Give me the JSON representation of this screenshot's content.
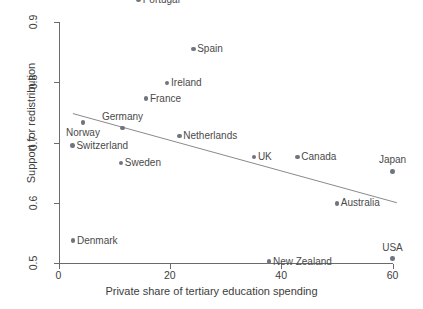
{
  "chart_data": {
    "type": "scatter",
    "title": "",
    "xlabel": "Private share of tertiary education spending",
    "ylabel": "Support for redistribution",
    "xlim": [
      0,
      60
    ],
    "ylim": [
      0.5,
      0.9
    ],
    "xticks": [
      "0",
      "20",
      "40",
      "60"
    ],
    "xtick_values": [
      0,
      20,
      40,
      60
    ],
    "yticks": [
      "0.5",
      "0.6",
      "0.7",
      "0.8",
      "0.9"
    ],
    "ytick_values": [
      0.5,
      0.6,
      0.7,
      0.8,
      0.9
    ],
    "grid": false,
    "legend": "none",
    "marker_color": "#6e7481",
    "line_color": "#8a8a8a",
    "axis_color": "#6b6b6b",
    "points": [
      {
        "label": "Portugal",
        "x": 14.4,
        "y": 0.937,
        "label_pos": "right"
      },
      {
        "label": "Spain",
        "x": 24.2,
        "y": 0.855,
        "label_pos": "right"
      },
      {
        "label": "Ireland",
        "x": 19.5,
        "y": 0.799,
        "label_pos": "right"
      },
      {
        "label": "France",
        "x": 15.7,
        "y": 0.773,
        "label_pos": "right"
      },
      {
        "label": "Germany",
        "x": 11.5,
        "y": 0.724,
        "label_pos": "above"
      },
      {
        "label": "Norway",
        "x": 4.4,
        "y": 0.733,
        "label_pos": "below"
      },
      {
        "label": "Netherlands",
        "x": 21.7,
        "y": 0.711,
        "label_pos": "right"
      },
      {
        "label": "Switzerland",
        "x": 2.5,
        "y": 0.695,
        "label_pos": "right"
      },
      {
        "label": "UK",
        "x": 35.1,
        "y": 0.676,
        "label_pos": "right"
      },
      {
        "label": "Canada",
        "x": 42.9,
        "y": 0.676,
        "label_pos": "right"
      },
      {
        "label": "Sweden",
        "x": 11.2,
        "y": 0.666,
        "label_pos": "right"
      },
      {
        "label": "Japan",
        "x": 60.0,
        "y": 0.652,
        "label_pos": "above"
      },
      {
        "label": "Australia",
        "x": 50.0,
        "y": 0.599,
        "label_pos": "right"
      },
      {
        "label": "Denmark",
        "x": 2.6,
        "y": 0.537,
        "label_pos": "right"
      },
      {
        "label": "USA",
        "x": 60.0,
        "y": 0.507,
        "label_pos": "above"
      },
      {
        "label": "New Zealand",
        "x": 37.8,
        "y": 0.502,
        "label_pos": "right"
      }
    ],
    "fit_line": {
      "x0": 2.5,
      "y0": 0.748,
      "x1": 60.7,
      "y1": 0.6
    }
  }
}
